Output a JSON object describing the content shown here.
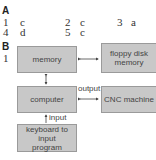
{
  "section_a": {
    "label": "A",
    "answers": [
      {
        "num": "1",
        "letter": "c"
      },
      {
        "num": "2",
        "letter": "c"
      },
      {
        "num": "3",
        "letter": "a"
      },
      {
        "num": "4",
        "letter": "d"
      },
      {
        "num": "5",
        "letter": "c"
      }
    ]
  },
  "section_b": {
    "label": "B",
    "item_number": "1",
    "boxes": {
      "memory": "memory",
      "floppy": "floppy disk memory",
      "computer": "computer",
      "cnc": "CNC machine",
      "keyboard": "keyboard to input program"
    },
    "edge_labels": {
      "output": "output",
      "input": "input"
    }
  },
  "colors": {
    "box_fill": "#c8c8c8",
    "box_border": "#9a9a9a",
    "text": "#444444"
  }
}
